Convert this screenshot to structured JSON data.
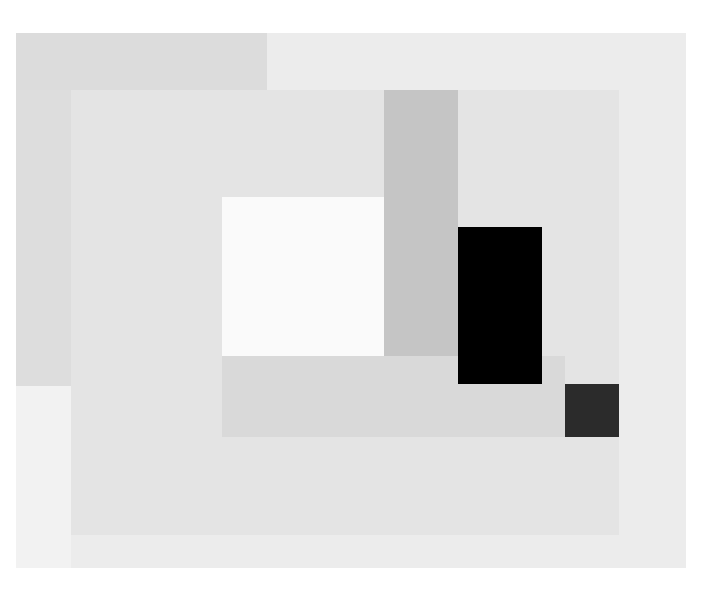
{
  "artwork": {
    "description": "Abstract geometric painting of overlapping grey, white and black rectangles",
    "colors": {
      "background": "#ffffff",
      "canvas": "#ececec",
      "top_left_band": "#dcdcdc",
      "left_strip": "#dddddd",
      "inner_panel": "#e4e4e4",
      "white_square": "#fafafa",
      "gray_vertical": "#c5c5c5",
      "lower_band": "#d9d9d9",
      "black_rect": "#000000",
      "dark_square": "#2b2b2b"
    }
  }
}
